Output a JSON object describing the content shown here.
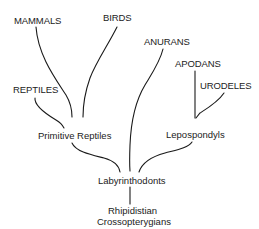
{
  "diagram": {
    "type": "phylogenetic-tree",
    "nodes": {
      "mammals": "MAMMALS",
      "birds": "BIRDS",
      "reptiles": "REPTILES",
      "primitive_reptiles": "Primitive Reptiles",
      "anurans": "ANURANS",
      "apodans": "APODANS",
      "urodeles": "URODELES",
      "lepospondyls": "Lepospondyls",
      "labyrinthodonts": "Labyrinthodonts",
      "rhipidistian_line1": "Rhipidistian",
      "rhipidistian_line2": "Crossopterygians"
    },
    "edges": [
      {
        "from": "Rhipidistian Crossopterygians",
        "to": "Labyrinthodonts"
      },
      {
        "from": "Labyrinthodonts",
        "to": "Primitive Reptiles"
      },
      {
        "from": "Labyrinthodonts",
        "to": "ANURANS"
      },
      {
        "from": "Labyrinthodonts",
        "to": "Lepospondyls"
      },
      {
        "from": "Primitive Reptiles",
        "to": "MAMMALS"
      },
      {
        "from": "Primitive Reptiles",
        "to": "BIRDS"
      },
      {
        "from": "Primitive Reptiles",
        "to": "REPTILES"
      },
      {
        "from": "Lepospondyls",
        "to": "APODANS"
      },
      {
        "from": "Lepospondyls",
        "to": "URODELES"
      }
    ],
    "colors": {
      "line": "#1a1a1a",
      "text": "#222222",
      "background": "#ffffff"
    }
  }
}
